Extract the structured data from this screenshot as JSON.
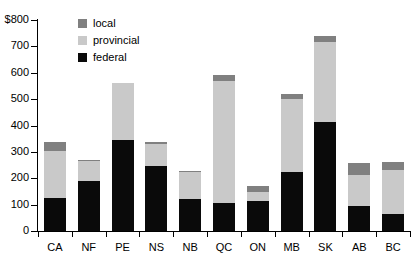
{
  "chart_data": {
    "type": "bar",
    "stacked": true,
    "title": "",
    "subtitle": "",
    "xlabel": "",
    "ylabel": "",
    "ylim": [
      0,
      800
    ],
    "y_tick_labels": [
      "$800",
      "700",
      "600",
      "500",
      "400",
      "300",
      "200",
      "100",
      "0"
    ],
    "y_ticks": [
      800,
      700,
      600,
      500,
      400,
      300,
      200,
      100,
      0
    ],
    "grid": false,
    "legend_position": "top-left-inside",
    "categories": [
      "CA",
      "NF",
      "PE",
      "NS",
      "NB",
      "QC",
      "ON",
      "MB",
      "SK",
      "AB",
      "BC"
    ],
    "series": [
      {
        "name": "federal",
        "color": "#0a0a0a",
        "values": [
          125,
          188,
          345,
          245,
          122,
          105,
          115,
          225,
          415,
          93,
          65
        ]
      },
      {
        "name": "provincial",
        "color": "#c9c9c9",
        "values": [
          180,
          78,
          215,
          85,
          100,
          465,
          32,
          275,
          300,
          120,
          168
        ]
      },
      {
        "name": "local",
        "color": "#808080",
        "values": [
          32,
          5,
          0,
          8,
          7,
          22,
          22,
          18,
          25,
          45,
          30
        ]
      }
    ],
    "totals": [
      337,
      271,
      560,
      338,
      229,
      592,
      169,
      518,
      740,
      258,
      263
    ]
  },
  "legend": {
    "items": [
      {
        "label": "local",
        "color": "#808080"
      },
      {
        "label": "provincial",
        "color": "#c9c9c9"
      },
      {
        "label": "federal",
        "color": "#0a0a0a"
      }
    ]
  },
  "colors": {
    "axis": "#000000",
    "background": "#ffffff",
    "federal": "#0a0a0a",
    "provincial": "#c9c9c9",
    "local": "#808080"
  }
}
